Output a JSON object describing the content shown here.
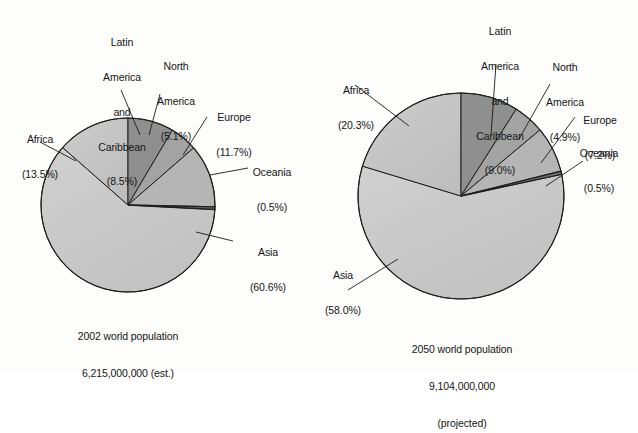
{
  "figure": {
    "background": "#fdfdfc",
    "line_color": "#1a1a1a"
  },
  "chart_data": [
    {
      "type": "pie",
      "id": "pie-2002",
      "title": "2002 world population",
      "subtitle": "6,215,000,000 (est.)",
      "caption_lines": [
        "2002 world population",
        "6,215,000,000 (est.)"
      ],
      "center": [
        128,
        205
      ],
      "radius": 87,
      "start_angle_deg": 0,
      "direction": "clockwise",
      "units": "percent",
      "total_label": "6,215,000,000",
      "categories": [
        "Latin America and Caribbean",
        "North America",
        "Europe",
        "Oceania",
        "Asia",
        "Africa"
      ],
      "values": [
        8.5,
        5.1,
        11.7,
        0.5,
        60.6,
        13.5
      ],
      "slice_colors": [
        "#8f8f8f",
        "#a3a3a3",
        "#b5b5b5",
        "#6e6e6e",
        "#c9c9c9",
        "#c2c2c2"
      ],
      "labels": [
        {
          "name": "latin-america-and-caribbean",
          "lines": [
            "Latin",
            "America",
            "and",
            "Caribbean",
            "(8.5%)"
          ],
          "percent": "8.5%"
        },
        {
          "name": "north-america",
          "lines": [
            "North",
            "America",
            "(5.1%)"
          ],
          "percent": "5.1%"
        },
        {
          "name": "europe",
          "lines": [
            "Europe",
            "(11.7%)"
          ],
          "percent": "11.7%"
        },
        {
          "name": "oceania",
          "lines": [
            "Oceania",
            "(0.5%)"
          ],
          "percent": "0.5%"
        },
        {
          "name": "asia",
          "lines": [
            "Asia",
            "(60.6%)"
          ],
          "percent": "60.6%"
        },
        {
          "name": "africa",
          "lines": [
            "Africa",
            "(13.5%)"
          ],
          "percent": "13.5%"
        }
      ]
    },
    {
      "type": "pie",
      "id": "pie-2050",
      "title": "2050 world population",
      "subtitle": "9,104,000,000 (projected)",
      "caption_lines": [
        "2050 world population",
        "9,104,000,000",
        "(projected)"
      ],
      "center": [
        461,
        196
      ],
      "radius": 103,
      "start_angle_deg": 0,
      "direction": "clockwise",
      "units": "percent",
      "total_label": "9,104,000,000",
      "categories": [
        "Latin America and Caribbean",
        "North America",
        "Europe",
        "Oceania",
        "Asia",
        "Africa"
      ],
      "values": [
        9.0,
        4.9,
        7.2,
        0.5,
        58.0,
        20.3
      ],
      "slice_colors": [
        "#8f8f8f",
        "#a3a3a3",
        "#b5b5b5",
        "#6e6e6e",
        "#c9c9c9",
        "#c2c2c2"
      ],
      "labels": [
        {
          "name": "latin-america-and-caribbean",
          "lines": [
            "Latin",
            "America",
            "and",
            "Caribbean",
            "(9.0%)"
          ],
          "percent": "9.0%"
        },
        {
          "name": "north-america",
          "lines": [
            "North",
            "America",
            "(4.9%)"
          ],
          "percent": "4.9%"
        },
        {
          "name": "europe",
          "lines": [
            "Europe",
            "(7.2%)"
          ],
          "percent": "7.2%"
        },
        {
          "name": "oceania",
          "lines": [
            "Oceania",
            "(0.5%)"
          ],
          "percent": "0.5%"
        },
        {
          "name": "asia",
          "lines": [
            "Asia",
            "(58.0%)"
          ],
          "percent": "58.0%"
        },
        {
          "name": "africa",
          "lines": [
            "Africa",
            "(20.3%)"
          ],
          "percent": "20.3%"
        }
      ]
    }
  ],
  "left": {
    "labels": {
      "latin": {
        "l1": "Latin",
        "l2": "America",
        "l3": "and",
        "l4": "Caribbean",
        "l5": "(8.5%)"
      },
      "north": {
        "l1": "North",
        "l2": "America",
        "l3": "(5.1%)"
      },
      "europe": {
        "l1": "Europe",
        "l2": "(11.7%)"
      },
      "oceania": {
        "l1": "Oceania",
        "l2": "(0.5%)"
      },
      "asia": {
        "l1": "Asia",
        "l2": "(60.6%)"
      },
      "africa": {
        "l1": "Africa",
        "l2": "(13.5%)"
      }
    },
    "caption": {
      "l1": "2002 world population",
      "l2": "6,215,000,000 (est.)"
    }
  },
  "right": {
    "labels": {
      "latin": {
        "l1": "Latin",
        "l2": "America",
        "l3": "and",
        "l4": "Caribbean",
        "l5": "(9.0%)"
      },
      "north": {
        "l1": "North",
        "l2": "America",
        "l3": "(4.9%)"
      },
      "europe": {
        "l1": "Europe",
        "l2": "(7.2%)"
      },
      "oceania": {
        "l1": "Oceania",
        "l2": "(0.5%)"
      },
      "asia": {
        "l1": "Asia",
        "l2": "(58.0%)"
      },
      "africa": {
        "l1": "Africa",
        "l2": "(20.3%)"
      }
    },
    "caption": {
      "l1": "2050 world population",
      "l2": "9,104,000,000",
      "l3": "(projected)"
    }
  }
}
